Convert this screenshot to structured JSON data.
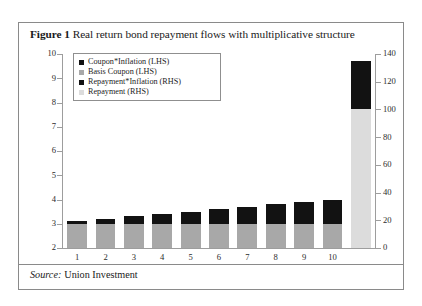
{
  "caption": {
    "number": "Figure 1",
    "text": "Real return bond repayment flows with multiplicative structure"
  },
  "source": {
    "lead": "Source:",
    "value": "Union Investment"
  },
  "legend": {
    "items": [
      {
        "label": "Coupon*Inflation (LHS)",
        "swatch": "sw-coupon",
        "color": "#121212",
        "icon": "square-swatch-icon"
      },
      {
        "label": "Basis Coupon (LHS)",
        "swatch": "sw-basis",
        "color": "#a8a8a8",
        "icon": "square-swatch-icon"
      },
      {
        "label": "Repayment*Inflation (RHS)",
        "swatch": "sw-repayinf",
        "color": "#121212",
        "icon": "square-swatch-icon"
      },
      {
        "label": "Repayment (RHS)",
        "swatch": "sw-repay",
        "color": "#dcdcdc",
        "icon": "square-swatch-icon"
      }
    ]
  },
  "chart_data": {
    "type": "bar",
    "title": "Real return bond repayment flows with multiplicative structure",
    "xlabel": "",
    "ylabel": "",
    "stacked": true,
    "grid": false,
    "legend_position": "top-left-inside",
    "categories": [
      "1",
      "2",
      "3",
      "4",
      "5",
      "6",
      "7",
      "8",
      "9",
      "10",
      ""
    ],
    "left_axis": {
      "label": "LHS",
      "ylim": [
        2,
        10
      ],
      "ticks": [
        2,
        3,
        4,
        5,
        6,
        7,
        8,
        9,
        10
      ],
      "tick_labels": [
        "2",
        "3",
        "4",
        "5",
        "6",
        "7",
        "8",
        "9",
        "10"
      ]
    },
    "right_axis": {
      "label": "RHS",
      "ylim": [
        0,
        140
      ],
      "ticks": [
        0,
        20,
        40,
        60,
        80,
        100,
        120,
        140
      ],
      "tick_labels": [
        "0",
        "20",
        "40",
        "60",
        "80",
        "100",
        "120",
        "140"
      ]
    },
    "series": [
      {
        "name": "Basis Coupon (LHS)",
        "axis": "left",
        "color": "#a8a8a8",
        "values": [
          3.0,
          3.0,
          3.0,
          3.0,
          3.0,
          3.0,
          3.0,
          3.0,
          3.0,
          3.0,
          null
        ]
      },
      {
        "name": "Coupon*Inflation (LHS)",
        "axis": "left",
        "color": "#121212",
        "values": [
          0.1,
          0.2,
          0.3,
          0.4,
          0.5,
          0.6,
          0.7,
          0.8,
          0.9,
          1.0,
          null
        ]
      },
      {
        "name": "Repayment (RHS)",
        "axis": "right",
        "color": "#dcdcdc",
        "values": [
          null,
          null,
          null,
          null,
          null,
          null,
          null,
          null,
          null,
          null,
          100
        ]
      },
      {
        "name": "Repayment*Inflation (RHS)",
        "axis": "right",
        "color": "#121212",
        "values": [
          null,
          null,
          null,
          null,
          null,
          null,
          null,
          null,
          null,
          null,
          35
        ]
      }
    ],
    "bar_totals_left": [
      3.1,
      3.2,
      3.3,
      3.4,
      3.5,
      3.6,
      3.7,
      3.8,
      3.9,
      4.0
    ],
    "bar_total_right": 135
  }
}
